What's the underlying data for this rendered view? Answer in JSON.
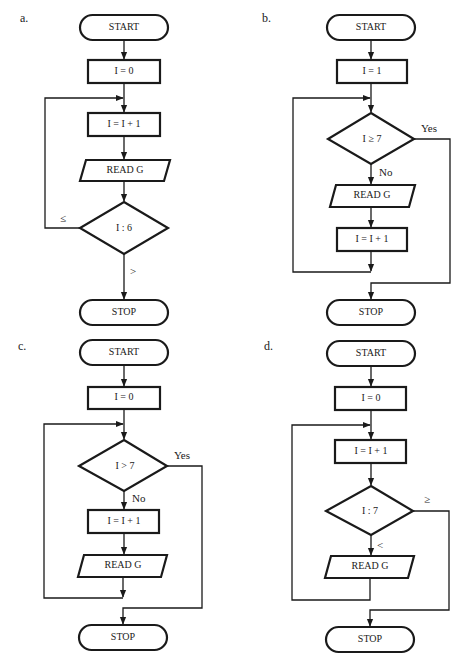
{
  "figure": {
    "panels": [
      {
        "label": "a.",
        "start": "START",
        "init": "I = 0",
        "increment": "I = I + 1",
        "read": "READ G",
        "decision": "I : 6",
        "loop_branch": "≤",
        "exit_branch": ">",
        "stop": "STOP"
      },
      {
        "label": "b.",
        "start": "START",
        "init": "I = 1",
        "decision": "I ≥ 7",
        "exit_branch": "Yes",
        "continue_branch": "No",
        "read": "READ G",
        "increment": "I = I + 1",
        "stop": "STOP"
      },
      {
        "label": "c.",
        "start": "START",
        "init": "I = 0",
        "decision": "I > 7",
        "exit_branch": "Yes",
        "continue_branch": "No",
        "increment": "I = I + 1",
        "read": "READ G",
        "stop": "STOP"
      },
      {
        "label": "d.",
        "start": "START",
        "init": "I = 0",
        "increment": "I = I + 1",
        "decision": "I : 7",
        "exit_branch": "≥",
        "continue_branch": "<",
        "read": "READ G",
        "stop": "STOP"
      }
    ]
  }
}
